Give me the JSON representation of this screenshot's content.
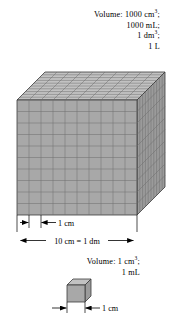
{
  "figure": {
    "title_top": {
      "lines": [
        {
          "prefix": "Volume: 1000 cm",
          "sup": "3",
          "suffix": ";"
        },
        {
          "prefix": "1000 mL;",
          "sup": "",
          "suffix": ""
        },
        {
          "prefix": "1 dm",
          "sup": "3",
          "suffix": ";"
        },
        {
          "prefix": "1 L",
          "sup": "",
          "suffix": ""
        }
      ],
      "line1_full": "Volume: 1000 cm3;",
      "line2_full": "1000 mL;",
      "line3_full": "1 dm3;",
      "line4_full": "1 L"
    },
    "title_bottom": {
      "lines": [
        {
          "prefix": "Volume: 1 cm",
          "sup": "3",
          "suffix": ";"
        },
        {
          "prefix": "1 mL",
          "sup": "",
          "suffix": ""
        }
      ],
      "line1_full": "Volume: 1 cm3;",
      "line2_full": "1 mL"
    },
    "dimensions": {
      "cell_label": "1 cm",
      "edge_label": "10 cm = 1 dm",
      "small_cube_label": "1 cm"
    },
    "large_cube": {
      "grid_divisions": 10,
      "front_fill": "#a8a8a8",
      "top_fill": "#c2c2c2",
      "side_fill": "#9b9b9b",
      "grid_stroke": "#6d6d6d",
      "outline_stroke": "#3a3a3a"
    },
    "small_cube": {
      "front_fill": "#a8a8a8",
      "top_fill": "#c2c2c2",
      "side_fill": "#9b9b9b",
      "outline_stroke": "#3a3a3a"
    }
  }
}
